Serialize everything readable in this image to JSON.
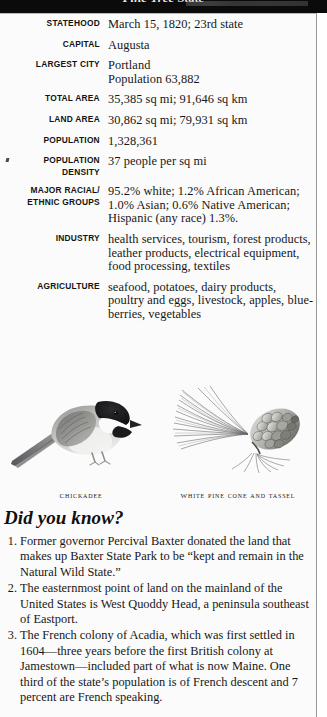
{
  "page": {
    "banner_title": "Pine Tree State"
  },
  "facts": [
    {
      "label": "STATEHOOD",
      "value": "March 15, 1820; 23rd state"
    },
    {
      "label": "CAPITAL",
      "value": "Augusta"
    },
    {
      "label": "LARGEST CITY",
      "value": "Portland\nPopulation 63,882"
    },
    {
      "label": "TOTAL AREA",
      "value": "35,385 sq mi; 91,646 sq km"
    },
    {
      "label": "LAND AREA",
      "value": "30,862 sq mi; 79,931 sq km"
    },
    {
      "label": "POPULATION",
      "value": "1,328,361"
    },
    {
      "label": "POPULATION\nDENSITY",
      "value": "37 people per sq mi"
    },
    {
      "label": "MAJOR RACIAL/\nETHNIC GROUPS",
      "value": "95.2% white; 1.2% African American;\n1.0% Asian; 0.6% Native American;\nHispanic (any race) 1.3%."
    },
    {
      "label": "INDUSTRY",
      "value": "health services, tourism, forest products,\nleather products, electrical equipment,\nfood processing, textiles"
    },
    {
      "label": "AGRICULTURE",
      "value": "seafood, potatoes, dairy products,\npoultry and eggs, livestock, apples, blue-\nberries, vegetables"
    }
  ],
  "plates": [
    {
      "caption": "Chickadee"
    },
    {
      "caption": "White Pine Cone and Tassel"
    }
  ],
  "did_you_know": {
    "title": "Did you know?",
    "items": [
      {
        "num": "1.",
        "text": "Former governor Percival Baxter donated the land that makes up Baxter State Park to be “kept and remain in the Natural Wild State.”"
      },
      {
        "num": "2.",
        "text": "The easternmost point of land on the mainland of the United States is West Quoddy Head, a peninsula southeast of Eastport."
      },
      {
        "num": "3.",
        "text": "The French colony of Acadia, which was first settled in 1604—three years before the first British colony at Jamestown—included part of what is now Maine. One third of the state’s population is of French descent and 7 percent are French speaking."
      }
    ]
  }
}
